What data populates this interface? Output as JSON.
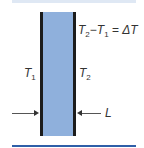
{
  "diagram": {
    "slab": {
      "fill_color": "#8fb0dc",
      "border_color": "#1c1c1c"
    },
    "labels": {
      "equation": {
        "t2": "T",
        "t2_sub": "2",
        "minus": "−",
        "t1": "T",
        "t1_sub": "1",
        "equals": " = ",
        "delta": "ΔT"
      },
      "left_face": {
        "symbol": "T",
        "sub": "1"
      },
      "right_face": {
        "symbol": "T",
        "sub": "2"
      },
      "thickness": "L"
    },
    "colors": {
      "top_strip": "#dfe8f4",
      "bottom_rule": "#2f5fa8",
      "arrow": "#333333",
      "text": "#333333"
    }
  }
}
